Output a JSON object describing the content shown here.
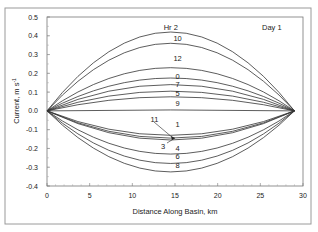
{
  "chart_data": {
    "type": "line",
    "title": "",
    "annotation": "Day 1",
    "xlabel": "Distance Along Basin, km",
    "ylabel": "Current, m s",
    "ylabel_superscript": "-1",
    "xlim": [
      0,
      30
    ],
    "ylim": [
      -0.4,
      0.5
    ],
    "xticks": [
      0,
      5,
      10,
      15,
      20,
      25,
      30
    ],
    "yticks": [
      0.5,
      0.4,
      0.3,
      0.2,
      0.1,
      0.0,
      -0.1,
      -0.2,
      -0.3,
      -0.4
    ],
    "ytick_labels": [
      "0.5",
      "0.4",
      "0.3",
      "0.2",
      "0.1",
      "0.0",
      "-0.1",
      "-0.2",
      "-0.3",
      "-0.4"
    ],
    "grid": false,
    "legend": "none (curves labeled inline)",
    "curve_shape": "parabolic arc from x=0 to x=29, zero at both ends, peak at x≈14.5",
    "x_start": 0,
    "x_end": 29,
    "series": [
      {
        "name": "Hr 2",
        "peak": 0.42,
        "label_pos": [
          14.5,
          0.445
        ]
      },
      {
        "name": "10",
        "peak": 0.36,
        "label_pos": [
          15.3,
          0.385
        ]
      },
      {
        "name": "12",
        "peak": 0.23,
        "label_pos": [
          15.3,
          0.28
        ]
      },
      {
        "name": "0",
        "peak": 0.175,
        "label_pos": [
          15.3,
          0.185
        ]
      },
      {
        "name": "7",
        "peak": 0.14,
        "label_pos": [
          15.3,
          0.14
        ]
      },
      {
        "name": "5",
        "peak": 0.105,
        "label_pos": [
          15.3,
          0.095
        ]
      },
      {
        "name": "9",
        "peak": 0.075,
        "label_pos": [
          15.3,
          0.04
        ]
      },
      {
        "name": "",
        "peak": 0.005,
        "label_pos": null
      },
      {
        "name": "1",
        "peak": -0.13,
        "label_pos": [
          15.3,
          -0.075
        ]
      },
      {
        "name": "11",
        "peak": -0.145,
        "label_pos": [
          12.6,
          -0.045
        ]
      },
      {
        "name": "3",
        "peak": -0.155,
        "label_pos": [
          13.6,
          -0.19
        ]
      },
      {
        "name": "4",
        "peak": -0.23,
        "label_pos": [
          15.3,
          -0.2
        ]
      },
      {
        "name": "6",
        "peak": -0.28,
        "label_pos": [
          15.3,
          -0.245
        ]
      },
      {
        "name": "8",
        "peak": -0.325,
        "label_pos": [
          15.3,
          -0.29
        ]
      }
    ]
  }
}
